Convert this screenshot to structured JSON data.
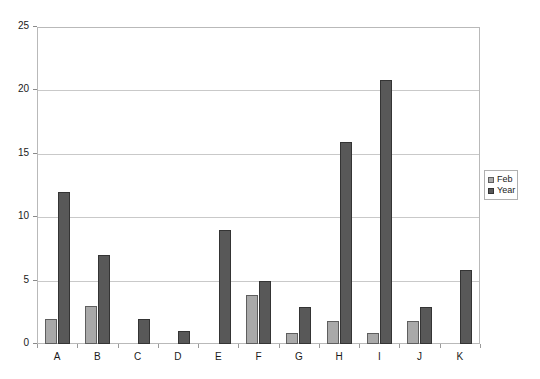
{
  "chart_data": {
    "type": "bar",
    "title": "",
    "subtitle": "",
    "xlabel": "",
    "ylabel": "",
    "categories": [
      "A",
      "B",
      "C",
      "D",
      "E",
      "F",
      "G",
      "H",
      "I",
      "J",
      "K"
    ],
    "series": [
      {
        "name": "Feb",
        "color": "#a9a9a9",
        "values": [
          2,
          3,
          null,
          null,
          null,
          3.9,
          0.9,
          1.8,
          0.9,
          1.8,
          null
        ]
      },
      {
        "name": "Year",
        "color": "#585858",
        "values": [
          12,
          7,
          2,
          1,
          9,
          5,
          2.9,
          15.9,
          20.8,
          2.9,
          5.8
        ]
      }
    ],
    "ylim": [
      0,
      25
    ],
    "yticks": [
      0,
      5,
      10,
      15,
      20,
      25
    ],
    "ytick_labels": [
      "0",
      "5",
      "10",
      "15",
      "20",
      "25"
    ],
    "grid": true,
    "grid_axis": "y",
    "legend": {
      "position": "right",
      "entries": [
        {
          "label": "Feb",
          "color": "#a9a9a9"
        },
        {
          "label": "Year",
          "color": "#585858"
        }
      ]
    },
    "annotations": []
  }
}
